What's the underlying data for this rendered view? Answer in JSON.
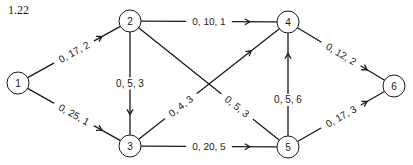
{
  "figure": {
    "label": "1.22"
  },
  "nodes": [
    {
      "id": "1",
      "x": 18,
      "y": 83
    },
    {
      "id": "2",
      "x": 130,
      "y": 21
    },
    {
      "id": "3",
      "x": 130,
      "y": 146
    },
    {
      "id": "4",
      "x": 288,
      "y": 22
    },
    {
      "id": "5",
      "x": 288,
      "y": 147
    },
    {
      "id": "6",
      "x": 394,
      "y": 86
    }
  ],
  "edges": [
    {
      "from": "1",
      "to": "2",
      "label": "0, 17, 2"
    },
    {
      "from": "1",
      "to": "3",
      "label": "0, 25, 1"
    },
    {
      "from": "2",
      "to": "4",
      "label": "0, 10, 1"
    },
    {
      "from": "2",
      "to": "3",
      "label": "0, 5, 3"
    },
    {
      "from": "2",
      "to": "5",
      "label": "0, 5, 3"
    },
    {
      "from": "3",
      "to": "4",
      "label": "0, 4, 3"
    },
    {
      "from": "3",
      "to": "5",
      "label": "0, 20, 5"
    },
    {
      "from": "5",
      "to": "4",
      "label": "0, 5, 6"
    },
    {
      "from": "4",
      "to": "6",
      "label": "0, 12, 2"
    },
    {
      "from": "5",
      "to": "6",
      "label": "0, 17, 3"
    }
  ]
}
